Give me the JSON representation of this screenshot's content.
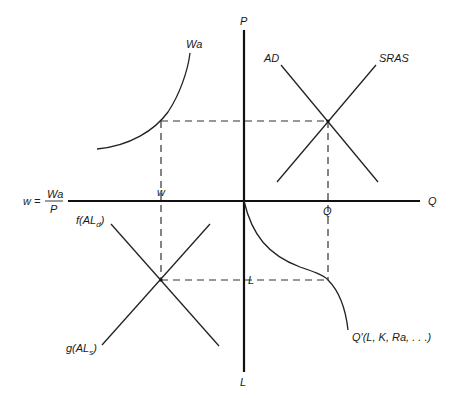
{
  "diagram": {
    "axes": {
      "vertical_top": "P",
      "vertical_bottom": "L",
      "horizontal_right": "Q",
      "horizontal_left_lhs": "w =",
      "horizontal_left_num": "Wa",
      "horizontal_left_den": "P"
    },
    "quadrants": {
      "top_left": {
        "curve_label": "Wa"
      },
      "top_right": {
        "demand_label": "AD",
        "supply_label": "SRAS"
      },
      "bottom_left": {
        "demand_label_f": "f(AL",
        "demand_sub": "d",
        "supply_label_g": "g(AL",
        "supply_sub": "s",
        "close_paren": ")"
      },
      "bottom_right": {
        "curve_label": "Q'(L, K, Ra, . . .)"
      }
    },
    "markers": {
      "w": "w",
      "Q": "Q",
      "L": "L"
    }
  }
}
